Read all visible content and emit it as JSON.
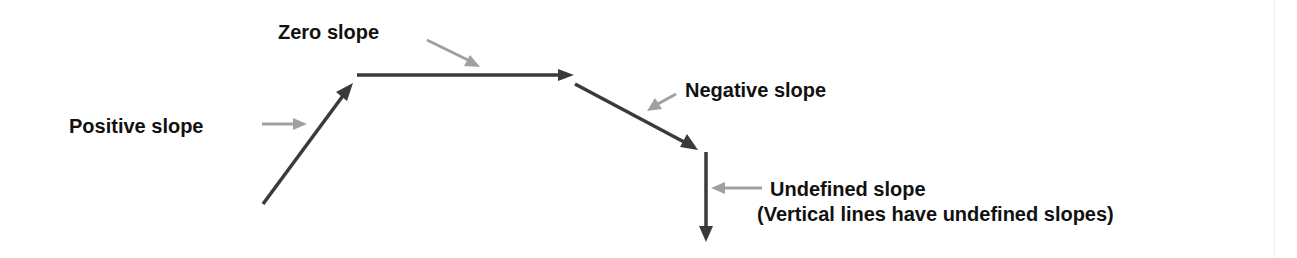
{
  "diagram": {
    "colors": {
      "main_arrow": "#3a3a3a",
      "pointer_arrow": "#a0a0a0",
      "text": "#111111"
    },
    "segments": [
      {
        "id": "positive",
        "from": [
          263,
          204
        ],
        "to": [
          353,
          83
        ]
      },
      {
        "id": "zero",
        "from": [
          357,
          75
        ],
        "to": [
          573,
          75
        ]
      },
      {
        "id": "negative",
        "from": [
          575,
          84
        ],
        "to": [
          697,
          149
        ]
      },
      {
        "id": "undefined",
        "from": [
          706,
          152
        ],
        "to": [
          706,
          240
        ]
      }
    ],
    "labels": {
      "positive": "Positive slope",
      "zero": "Zero slope",
      "negative": "Negative slope",
      "undefined": "Undefined slope",
      "undefined_note": "(Vertical lines have undefined slopes)"
    }
  }
}
